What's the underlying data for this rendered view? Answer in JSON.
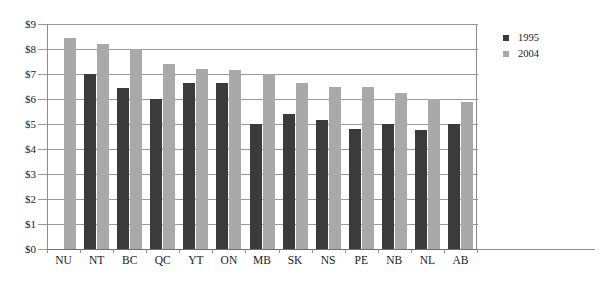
{
  "chart_data": {
    "type": "bar",
    "title": "",
    "subtitle": "",
    "xlabel": "",
    "ylabel": "",
    "ylim": [
      0,
      9
    ],
    "ytick_labels": [
      "$9",
      "$8",
      "$7",
      "$6",
      "$5",
      "$4",
      "$3",
      "$2",
      "$1",
      "$0"
    ],
    "ytick_values": [
      9,
      8,
      7,
      6,
      5,
      4,
      3,
      2,
      1,
      0
    ],
    "grid": "horizontal",
    "legend_position": "right",
    "categories": [
      "NU",
      "NT",
      "BC",
      "QC",
      "YT",
      "ON",
      "MB",
      "SK",
      "NS",
      "PE",
      "NB",
      "NL",
      "AB"
    ],
    "series": [
      {
        "name": "1995",
        "color": "#3b3b3b",
        "values": [
          null,
          7.0,
          6.45,
          6.0,
          6.65,
          6.65,
          5.0,
          5.4,
          5.15,
          4.8,
          5.0,
          4.78,
          5.0
        ]
      },
      {
        "name": "2004",
        "color": "#a9a9a9",
        "values": [
          8.45,
          8.2,
          8.0,
          7.4,
          7.2,
          7.15,
          7.0,
          6.65,
          6.5,
          6.5,
          6.25,
          6.0,
          5.9
        ]
      }
    ]
  },
  "legend": {
    "entries": [
      {
        "label": "1995",
        "swatch_color": "#3b3b3b"
      },
      {
        "label": "2004",
        "swatch_color": "#a9a9a9"
      }
    ]
  },
  "colors": {
    "series_1995": "#3b3b3b",
    "series_2004": "#a9a9a9",
    "gridline": "#9a9a9a",
    "axis": "#8c8c8c",
    "background": "#ffffff",
    "text": "#1a1a1a"
  }
}
